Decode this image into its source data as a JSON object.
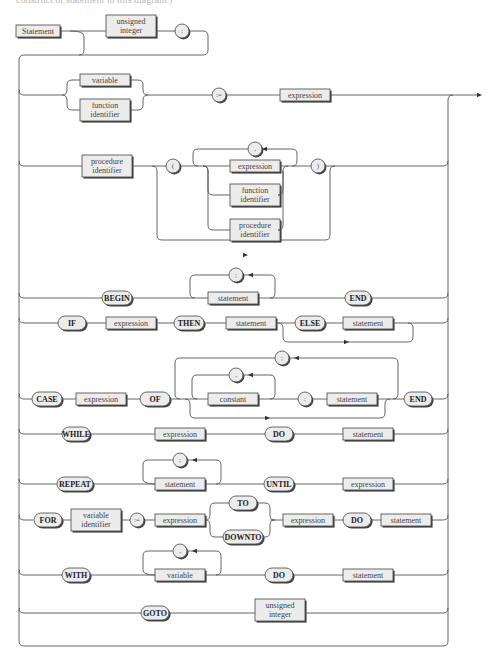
{
  "caption": "construct or statement in this diagram.)",
  "title_box": "Statement",
  "label_prefix": {
    "unsigned_integer": [
      "unsigned",
      "integer"
    ],
    "colon": ":",
    "assign": ":=",
    "lparen": "(",
    "rparen": ")",
    "comma": ",",
    "semicolon": ";"
  },
  "rows": {
    "assignment": {
      "alternatives": [
        [
          "variable"
        ],
        [
          "function",
          "identifier"
        ]
      ],
      "op": ":=",
      "rhs": "expression"
    },
    "procedure_call": {
      "name": [
        "procedure",
        "identifier"
      ],
      "lparen": "(",
      "params": [
        [
          "expression"
        ],
        [
          "function",
          "identifier"
        ],
        [
          "procedure",
          "identifier"
        ]
      ],
      "separator": ",",
      "rparen": ")"
    },
    "compound": {
      "begin": "BEGIN",
      "body": "statement",
      "separator": ";",
      "end": "END"
    },
    "if": {
      "kw_if": "IF",
      "cond": "expression",
      "kw_then": "THEN",
      "then_stmt": "statement",
      "kw_else": "ELSE",
      "else_stmt": "statement"
    },
    "case": {
      "kw_case": "CASE",
      "selector": "expression",
      "kw_of": "OF",
      "label": "constant",
      "label_sep": ",",
      "colon": ":",
      "body": "statement",
      "case_sep": ";",
      "kw_end": "END"
    },
    "while": {
      "kw_while": "WHILE",
      "cond": "expression",
      "kw_do": "DO",
      "body": "statement"
    },
    "repeat": {
      "kw_repeat": "REPEAT",
      "body": "statement",
      "separator": ";",
      "kw_until": "UNTIL",
      "cond": "expression"
    },
    "for": {
      "kw_for": "FOR",
      "var": [
        "variable",
        "identifier"
      ],
      "assign": ":=",
      "start": "expression",
      "kw_to": "TO",
      "kw_downto": "DOWNTO",
      "end": "expression",
      "kw_do": "DO",
      "body": "statement"
    },
    "with": {
      "kw_with": "WITH",
      "var": "variable",
      "separator": ",",
      "kw_do": "DO",
      "body": "statement"
    },
    "goto": {
      "kw_goto": "GOTO",
      "target": [
        "unsigned",
        "integer"
      ]
    }
  },
  "colors": {
    "line": "#555555",
    "box_fill": "#ececec",
    "shadow": "#444444"
  }
}
